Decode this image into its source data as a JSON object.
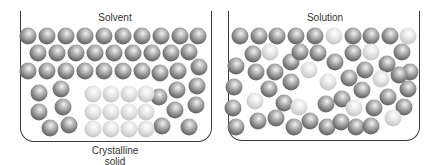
{
  "diagram": {
    "left_panel": {
      "top_label": "Solvent",
      "bottom_label_line1": "Crystalline",
      "bottom_label_line2": "solid"
    },
    "right_panel": {
      "top_label": "Solution"
    },
    "colors": {
      "container_stroke": "#3a3a3a",
      "solvent_particle": "#7a7a7a",
      "solute_particle": "#c9c9c9"
    },
    "left_particles": [
      {
        "x": 28,
        "y": 36,
        "t": "dark"
      },
      {
        "x": 47,
        "y": 36,
        "t": "dark"
      },
      {
        "x": 66,
        "y": 36,
        "t": "dark"
      },
      {
        "x": 85,
        "y": 36,
        "t": "dark"
      },
      {
        "x": 104,
        "y": 36,
        "t": "dark"
      },
      {
        "x": 123,
        "y": 36,
        "t": "dark"
      },
      {
        "x": 142,
        "y": 36,
        "t": "dark"
      },
      {
        "x": 161,
        "y": 36,
        "t": "dark"
      },
      {
        "x": 180,
        "y": 36,
        "t": "dark"
      },
      {
        "x": 198,
        "y": 36,
        "t": "dark"
      },
      {
        "x": 38,
        "y": 53,
        "t": "dark"
      },
      {
        "x": 57,
        "y": 53,
        "t": "dark"
      },
      {
        "x": 76,
        "y": 53,
        "t": "dark"
      },
      {
        "x": 95,
        "y": 53,
        "t": "dark"
      },
      {
        "x": 114,
        "y": 53,
        "t": "dark"
      },
      {
        "x": 133,
        "y": 53,
        "t": "dark"
      },
      {
        "x": 152,
        "y": 53,
        "t": "dark"
      },
      {
        "x": 171,
        "y": 53,
        "t": "dark"
      },
      {
        "x": 189,
        "y": 52,
        "t": "dark"
      },
      {
        "x": 28,
        "y": 71,
        "t": "dark"
      },
      {
        "x": 47,
        "y": 71,
        "t": "dark"
      },
      {
        "x": 66,
        "y": 71,
        "t": "dark"
      },
      {
        "x": 85,
        "y": 71,
        "t": "dark"
      },
      {
        "x": 104,
        "y": 71,
        "t": "dark"
      },
      {
        "x": 123,
        "y": 71,
        "t": "dark"
      },
      {
        "x": 142,
        "y": 71,
        "t": "dark"
      },
      {
        "x": 160,
        "y": 73,
        "t": "dark"
      },
      {
        "x": 178,
        "y": 71,
        "t": "dark"
      },
      {
        "x": 199,
        "y": 67,
        "t": "dark"
      },
      {
        "x": 39,
        "y": 93,
        "t": "dark"
      },
      {
        "x": 61,
        "y": 89,
        "t": "dark"
      },
      {
        "x": 39,
        "y": 112,
        "t": "dark"
      },
      {
        "x": 63,
        "y": 107,
        "t": "dark"
      },
      {
        "x": 50,
        "y": 128,
        "t": "dark"
      },
      {
        "x": 69,
        "y": 125,
        "t": "dark"
      },
      {
        "x": 159,
        "y": 97,
        "t": "dark"
      },
      {
        "x": 177,
        "y": 90,
        "t": "dark"
      },
      {
        "x": 197,
        "y": 86,
        "t": "dark"
      },
      {
        "x": 175,
        "y": 110,
        "t": "dark"
      },
      {
        "x": 196,
        "y": 105,
        "t": "dark"
      },
      {
        "x": 162,
        "y": 126,
        "t": "dark"
      },
      {
        "x": 189,
        "y": 127,
        "t": "dark"
      },
      {
        "x": 93,
        "y": 94,
        "t": "light"
      },
      {
        "x": 111,
        "y": 94,
        "t": "light"
      },
      {
        "x": 129,
        "y": 94,
        "t": "light"
      },
      {
        "x": 146,
        "y": 94,
        "t": "light"
      },
      {
        "x": 93,
        "y": 112,
        "t": "light"
      },
      {
        "x": 111,
        "y": 112,
        "t": "light"
      },
      {
        "x": 129,
        "y": 112,
        "t": "light"
      },
      {
        "x": 146,
        "y": 112,
        "t": "light"
      },
      {
        "x": 93,
        "y": 129,
        "t": "light"
      },
      {
        "x": 111,
        "y": 129,
        "t": "light"
      },
      {
        "x": 129,
        "y": 129,
        "t": "light"
      },
      {
        "x": 146,
        "y": 129,
        "t": "light"
      }
    ],
    "right_particles": [
      {
        "x": 240,
        "y": 36,
        "t": "dark"
      },
      {
        "x": 259,
        "y": 36,
        "t": "dark"
      },
      {
        "x": 277,
        "y": 36,
        "t": "dark"
      },
      {
        "x": 296,
        "y": 36,
        "t": "dark"
      },
      {
        "x": 315,
        "y": 36,
        "t": "dark"
      },
      {
        "x": 334,
        "y": 36,
        "t": "light"
      },
      {
        "x": 353,
        "y": 36,
        "t": "dark"
      },
      {
        "x": 371,
        "y": 36,
        "t": "dark"
      },
      {
        "x": 390,
        "y": 36,
        "t": "dark"
      },
      {
        "x": 408,
        "y": 36,
        "t": "light"
      },
      {
        "x": 253,
        "y": 54,
        "t": "dark"
      },
      {
        "x": 270,
        "y": 52,
        "t": "light"
      },
      {
        "x": 236,
        "y": 66,
        "t": "dark"
      },
      {
        "x": 256,
        "y": 72,
        "t": "dark"
      },
      {
        "x": 275,
        "y": 72,
        "t": "dark"
      },
      {
        "x": 291,
        "y": 62,
        "t": "dark"
      },
      {
        "x": 300,
        "y": 52,
        "t": "dark"
      },
      {
        "x": 318,
        "y": 53,
        "t": "dark"
      },
      {
        "x": 335,
        "y": 62,
        "t": "dark"
      },
      {
        "x": 234,
        "y": 87,
        "t": "dark"
      },
      {
        "x": 269,
        "y": 89,
        "t": "dark"
      },
      {
        "x": 291,
        "y": 82,
        "t": "dark"
      },
      {
        "x": 309,
        "y": 70,
        "t": "light"
      },
      {
        "x": 233,
        "y": 108,
        "t": "dark"
      },
      {
        "x": 255,
        "y": 101,
        "t": "light"
      },
      {
        "x": 284,
        "y": 103,
        "t": "dark"
      },
      {
        "x": 299,
        "y": 107,
        "t": "light"
      },
      {
        "x": 258,
        "y": 121,
        "t": "dark"
      },
      {
        "x": 276,
        "y": 118,
        "t": "dark"
      },
      {
        "x": 236,
        "y": 127,
        "t": "dark"
      },
      {
        "x": 294,
        "y": 127,
        "t": "dark"
      },
      {
        "x": 310,
        "y": 121,
        "t": "dark"
      },
      {
        "x": 353,
        "y": 53,
        "t": "dark"
      },
      {
        "x": 371,
        "y": 52,
        "t": "light"
      },
      {
        "x": 402,
        "y": 52,
        "t": "dark"
      },
      {
        "x": 349,
        "y": 78,
        "t": "dark"
      },
      {
        "x": 365,
        "y": 70,
        "t": "dark"
      },
      {
        "x": 387,
        "y": 64,
        "t": "dark"
      },
      {
        "x": 410,
        "y": 72,
        "t": "dark"
      },
      {
        "x": 328,
        "y": 82,
        "t": "light"
      },
      {
        "x": 381,
        "y": 79,
        "t": "light"
      },
      {
        "x": 399,
        "y": 75,
        "t": "dark"
      },
      {
        "x": 342,
        "y": 99,
        "t": "dark"
      },
      {
        "x": 362,
        "y": 90,
        "t": "dark"
      },
      {
        "x": 388,
        "y": 97,
        "t": "dark"
      },
      {
        "x": 408,
        "y": 89,
        "t": "dark"
      },
      {
        "x": 326,
        "y": 104,
        "t": "dark"
      },
      {
        "x": 354,
        "y": 108,
        "t": "light"
      },
      {
        "x": 374,
        "y": 108,
        "t": "dark"
      },
      {
        "x": 404,
        "y": 107,
        "t": "dark"
      },
      {
        "x": 327,
        "y": 127,
        "t": "dark"
      },
      {
        "x": 341,
        "y": 122,
        "t": "dark"
      },
      {
        "x": 356,
        "y": 127,
        "t": "dark"
      },
      {
        "x": 371,
        "y": 126,
        "t": "dark"
      },
      {
        "x": 393,
        "y": 118,
        "t": "light"
      }
    ]
  }
}
